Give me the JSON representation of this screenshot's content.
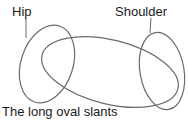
{
  "labels": {
    "hip": "Hip",
    "shoulder": "Shoulder"
  },
  "caption": "The long oval slants",
  "colors": {
    "stroke": "#6b6b6b",
    "text": "#1a1a1a",
    "background": "#ffffff"
  }
}
